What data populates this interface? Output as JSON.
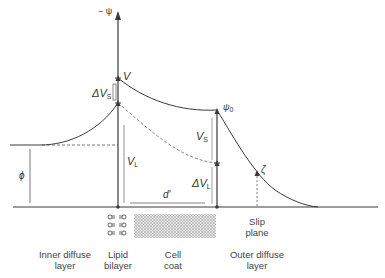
{
  "diagram": {
    "axis_label": "− ψ",
    "symbols": {
      "V": "V",
      "delta_vs": "ΔV",
      "delta_vs_sub": "S",
      "vl": "V",
      "vl_sub": "L",
      "vs": "V",
      "vs_sub": "S",
      "delta_vl": "ΔV",
      "delta_vl_sub": "L",
      "psi0": "ψ",
      "psi0_sub": "0",
      "zeta": "ζ",
      "phi": "ϕ",
      "d_prime": "d′"
    },
    "regions": [
      {
        "id": "inner-diffuse-layer",
        "line1": "Inner diffuse",
        "line2": "layer"
      },
      {
        "id": "lipid-bilayer",
        "line1": "Lipid",
        "line2": "bilayer"
      },
      {
        "id": "cell-coat",
        "line1": "Cell",
        "line2": "coat"
      },
      {
        "id": "outer-diffuse-layer",
        "line1": "Outer diffuse",
        "line2": "layer"
      }
    ],
    "slip_plane": {
      "line1": "Slip",
      "line2": "plane"
    },
    "colors": {
      "line": "#3a3a3a",
      "dashed": "#666666",
      "cell_coat_fill": "#c8c8c8"
    }
  }
}
